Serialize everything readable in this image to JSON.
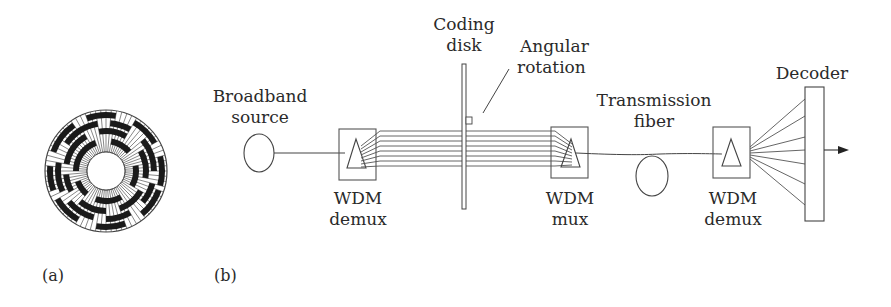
{
  "figure": {
    "panel_a": {
      "caption": "(a)",
      "element": "coding-disk-pattern"
    },
    "panel_b": {
      "caption": "(b)",
      "labels": {
        "broadband_source": [
          "Broadband",
          "source"
        ],
        "coding_disk": [
          "Coding",
          "disk"
        ],
        "angular_rotation": [
          "Angular",
          "rotation"
        ],
        "transmission_fiber": [
          "Transmission",
          "fiber"
        ],
        "decoder": "Decoder",
        "wdm_demux_1": [
          "WDM",
          "demux"
        ],
        "wdm_mux": [
          "WDM",
          "mux"
        ],
        "wdm_demux_2": [
          "WDM",
          "demux"
        ]
      }
    },
    "colors": {
      "line": "#444444",
      "fill_dark": "#1a1a1a",
      "text": "#2a2a2a"
    }
  }
}
